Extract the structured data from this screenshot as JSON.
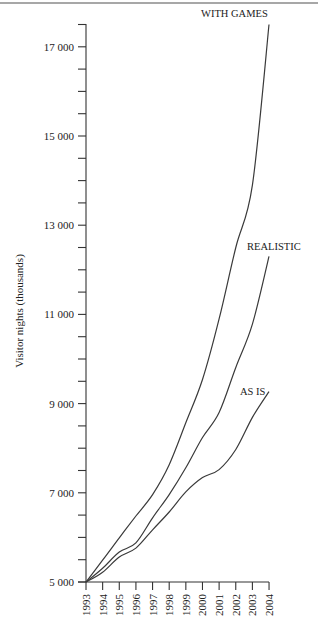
{
  "chart_data": {
    "type": "line",
    "title": "",
    "xlabel": "",
    "ylabel": "Visitor nights (thousands)",
    "ylim": [
      5000,
      17500
    ],
    "x": [
      1993,
      1994,
      1995,
      1996,
      1997,
      1998,
      1999,
      2000,
      2001,
      2002,
      2003,
      2004
    ],
    "y_tick_labels": [
      "5 000",
      "7 000",
      "9 000",
      "11 000",
      "13 000",
      "15 000",
      "17 000"
    ],
    "y_tick_values": [
      5000,
      7000,
      9000,
      11000,
      13000,
      15000,
      17000
    ],
    "y_minor_tick_step": 500,
    "x_tick_labels": [
      "1993",
      "1994",
      "1995",
      "1996",
      "1997",
      "1998",
      "1999",
      "2000",
      "2001",
      "2002",
      "2003",
      "2004"
    ],
    "grid": false,
    "legend": "inline labels at line ends",
    "series": [
      {
        "name": "WITH GAMES",
        "values": [
          5000,
          5490,
          5990,
          6480,
          6960,
          7630,
          8570,
          9540,
          10900,
          12500,
          13900,
          17500
        ]
      },
      {
        "name": "REALISTIC",
        "values": [
          5000,
          5310,
          5670,
          5880,
          6440,
          6960,
          7560,
          8240,
          8800,
          9810,
          10780,
          12300
        ]
      },
      {
        "name": "AS IS",
        "values": [
          5000,
          5220,
          5560,
          5760,
          6170,
          6570,
          7020,
          7340,
          7520,
          7970,
          8690,
          9270
        ]
      }
    ]
  },
  "labels": {
    "y_axis_title": "Visitor nights (thousands)",
    "with_games": "WITH GAMES",
    "realistic": "REALISTIC",
    "as_is": "AS IS"
  },
  "colors": {
    "line": "#3a3a3a",
    "axis": "#333333",
    "border": "#888888"
  }
}
